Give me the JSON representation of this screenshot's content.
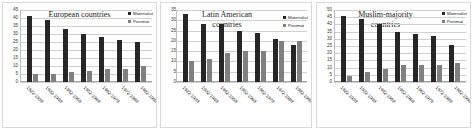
{
  "legend": {
    "materialist_label": "Materialist",
    "postmaterialist_label": "Postmat",
    "materialist_color": "#262626",
    "postmaterialist_color": "#808080"
  },
  "chart_data": [
    {
      "type": "bar",
      "title": "European countries",
      "xlabel": "",
      "ylabel": "",
      "ylim": [
        0,
        45
      ],
      "yticks": [
        0,
        5,
        10,
        15,
        20,
        25,
        30,
        35,
        40,
        45
      ],
      "grid": true,
      "legend_position": "top-right",
      "categories": [
        "1922-1938",
        "1932-1948",
        "1942-1958",
        "1952-1968",
        "1962-1978",
        "1972-1988",
        "1982-1998"
      ],
      "series": [
        {
          "name": "Materialist",
          "values": [
            41,
            39,
            33,
            30,
            28,
            26,
            25
          ]
        },
        {
          "name": "Postmat",
          "values": [
            5,
            5,
            6,
            7,
            8,
            8,
            10
          ]
        }
      ]
    },
    {
      "type": "bar",
      "title": "Latin American countries",
      "xlabel": "",
      "ylabel": "",
      "ylim": [
        0,
        35
      ],
      "yticks": [
        0,
        5,
        10,
        15,
        20,
        25,
        30,
        35
      ],
      "grid": true,
      "legend_position": "top-right",
      "categories": [
        "1922-1938",
        "1932-1948",
        "1942-1958",
        "1952-1968",
        "1962-1978",
        "1972-1988",
        "1982-1998"
      ],
      "series": [
        {
          "name": "Materialist",
          "values": [
            33,
            28,
            28,
            25,
            24,
            21,
            18
          ]
        },
        {
          "name": "Postmat",
          "values": [
            10,
            11,
            14,
            15,
            15,
            20,
            20
          ]
        }
      ]
    },
    {
      "type": "bar",
      "title": "Muslim-majority countries",
      "xlabel": "",
      "ylabel": "",
      "ylim": [
        0,
        50
      ],
      "yticks": [
        0,
        5,
        10,
        15,
        20,
        25,
        30,
        35,
        40,
        45,
        50
      ],
      "grid": true,
      "legend_position": "top-right",
      "categories": [
        "1922-1938",
        "1932-1948",
        "1942-1958",
        "1952-1968",
        "1962-1978",
        "1972-1988",
        "1982-1998"
      ],
      "series": [
        {
          "name": "Materialist",
          "values": [
            46,
            44,
            40,
            35,
            33,
            32,
            26
          ]
        },
        {
          "name": "Postmat",
          "values": [
            4,
            7,
            9,
            12,
            12,
            12,
            13
          ]
        }
      ]
    }
  ]
}
